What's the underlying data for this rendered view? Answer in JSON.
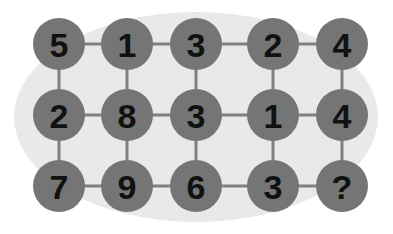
{
  "puzzle": {
    "type": "number-grid-puzzle",
    "rows": 3,
    "columns": 5,
    "unknown_marker": "?",
    "backdrop": {
      "shape": "ellipse",
      "color": "#e9e9e9",
      "center_x": 196,
      "center_y": 117,
      "radius_x": 182,
      "radius_y": 105
    },
    "node_style": {
      "fill": "#757575",
      "radius": 26,
      "text_color": "#111111"
    },
    "connector_style": {
      "color": "#808080",
      "width": 3
    },
    "geometry": {
      "column_x": [
        59,
        127,
        196,
        273,
        342
      ],
      "row_y": [
        44,
        115,
        186
      ]
    },
    "grid": [
      {
        "row_index": 0,
        "cells": [
          {
            "value": "5",
            "col": 0
          },
          {
            "value": "1",
            "col": 1
          },
          {
            "value": "3",
            "col": 2
          },
          {
            "value": "2",
            "col": 3
          },
          {
            "value": "4",
            "col": 4
          }
        ]
      },
      {
        "row_index": 1,
        "cells": [
          {
            "value": "2",
            "col": 0
          },
          {
            "value": "8",
            "col": 1
          },
          {
            "value": "3",
            "col": 2
          },
          {
            "value": "1",
            "col": 3
          },
          {
            "value": "4",
            "col": 4
          }
        ]
      },
      {
        "row_index": 2,
        "cells": [
          {
            "value": "7",
            "col": 0
          },
          {
            "value": "9",
            "col": 1
          },
          {
            "value": "6",
            "col": 2
          },
          {
            "value": "3",
            "col": 3
          },
          {
            "value": "?",
            "col": 4
          }
        ]
      }
    ]
  }
}
